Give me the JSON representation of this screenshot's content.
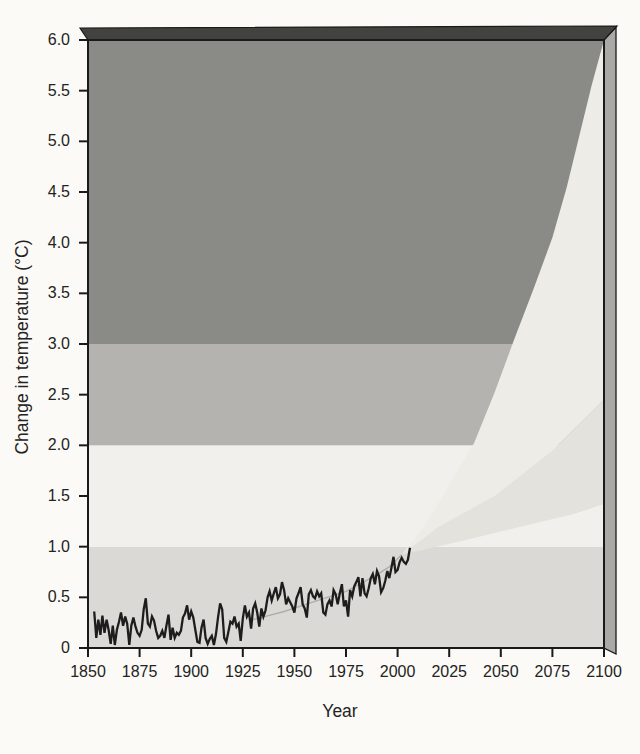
{
  "figure": {
    "kind": "textbook-climate-figure",
    "x_axis_title": "Year",
    "y_axis_title": "Change in temperature (°C)"
  },
  "chart_data": {
    "type": "line",
    "title": "",
    "xlabel": "Year",
    "ylabel": "Change in temperature (°C)",
    "xlim": [
      1850,
      2100
    ],
    "ylim": [
      0,
      6.0
    ],
    "grid": "off",
    "legend": "none",
    "x_ticks": [
      {
        "label": "1850",
        "value": 1850
      },
      {
        "label": "1875",
        "value": 1875
      },
      {
        "label": "1900",
        "value": 1900
      },
      {
        "label": "1925",
        "value": 1925
      },
      {
        "label": "1950",
        "value": 1950
      },
      {
        "label": "1975",
        "value": 1975
      },
      {
        "label": "2000",
        "value": 2000
      },
      {
        "label": "2025",
        "value": 2025
      },
      {
        "label": "2050",
        "value": 2050
      },
      {
        "label": "2075",
        "value": 2075
      },
      {
        "label": "2100",
        "value": 2100
      }
    ],
    "y_ticks": [
      {
        "label": "6.0",
        "value": 6.0
      },
      {
        "label": "5.5",
        "value": 5.5
      },
      {
        "label": "5.0",
        "value": 5.0
      },
      {
        "label": "4.5",
        "value": 4.5
      },
      {
        "label": "4.0",
        "value": 4.0
      },
      {
        "label": "3.5",
        "value": 3.5
      },
      {
        "label": "3.0",
        "value": 3.0
      },
      {
        "label": "2.5",
        "value": 2.5
      },
      {
        "label": "2.0",
        "value": 2.0
      },
      {
        "label": "1.5",
        "value": 1.5
      },
      {
        "label": "1.0",
        "value": 1.0
      },
      {
        "label": "0.5",
        "value": 0.5
      },
      {
        "label": "0",
        "value": 0
      }
    ],
    "background_bands": [
      {
        "range": [
          0,
          1
        ],
        "color": "#dad9d5"
      },
      {
        "range": [
          1,
          2
        ],
        "color": "#f1f0ec"
      },
      {
        "range": [
          2,
          3
        ],
        "color": "#b4b3af"
      },
      {
        "range": [
          3,
          6
        ],
        "color": "#8a8a86"
      }
    ],
    "observed": {
      "name": "observed-temperature-change",
      "points": [
        [
          1853,
          0.36
        ],
        [
          1854,
          0.1
        ],
        [
          1855,
          0.28
        ],
        [
          1856,
          0.13
        ],
        [
          1857,
          0.32
        ],
        [
          1858,
          0.15
        ],
        [
          1859,
          0.28
        ],
        [
          1860,
          0.18
        ],
        [
          1861,
          0.04
        ],
        [
          1862,
          0.22
        ],
        [
          1863,
          0.03
        ],
        [
          1864,
          0.18
        ],
        [
          1865,
          0.26
        ],
        [
          1866,
          0.35
        ],
        [
          1867,
          0.22
        ],
        [
          1868,
          0.31
        ],
        [
          1869,
          0.24
        ],
        [
          1870,
          0.03
        ],
        [
          1871,
          0.22
        ],
        [
          1872,
          0.3
        ],
        [
          1873,
          0.21
        ],
        [
          1874,
          0.15
        ],
        [
          1875,
          0.12
        ],
        [
          1876,
          0.18
        ],
        [
          1877,
          0.38
        ],
        [
          1878,
          0.49
        ],
        [
          1879,
          0.24
        ],
        [
          1880,
          0.21
        ],
        [
          1881,
          0.31
        ],
        [
          1882,
          0.27
        ],
        [
          1883,
          0.17
        ],
        [
          1884,
          0.1
        ],
        [
          1885,
          0.12
        ],
        [
          1886,
          0.17
        ],
        [
          1887,
          0.1
        ],
        [
          1888,
          0.22
        ],
        [
          1889,
          0.33
        ],
        [
          1890,
          0.08
        ],
        [
          1891,
          0.2
        ],
        [
          1892,
          0.1
        ],
        [
          1893,
          0.15
        ],
        [
          1894,
          0.13
        ],
        [
          1895,
          0.17
        ],
        [
          1896,
          0.3
        ],
        [
          1897,
          0.34
        ],
        [
          1898,
          0.42
        ],
        [
          1899,
          0.28
        ],
        [
          1900,
          0.36
        ],
        [
          1901,
          0.3
        ],
        [
          1902,
          0.18
        ],
        [
          1903,
          0.06
        ],
        [
          1904,
          0.05
        ],
        [
          1905,
          0.2
        ],
        [
          1906,
          0.28
        ],
        [
          1907,
          0.1
        ],
        [
          1908,
          0.04
        ],
        [
          1909,
          0.09
        ],
        [
          1910,
          0.12
        ],
        [
          1911,
          0.03
        ],
        [
          1912,
          0.14
        ],
        [
          1913,
          0.3
        ],
        [
          1914,
          0.44
        ],
        [
          1915,
          0.38
        ],
        [
          1916,
          0.1
        ],
        [
          1917,
          0.06
        ],
        [
          1918,
          0.16
        ],
        [
          1919,
          0.26
        ],
        [
          1920,
          0.24
        ],
        [
          1921,
          0.31
        ],
        [
          1922,
          0.21
        ],
        [
          1923,
          0.24
        ],
        [
          1924,
          0.07
        ],
        [
          1925,
          0.29
        ],
        [
          1926,
          0.42
        ],
        [
          1927,
          0.31
        ],
        [
          1928,
          0.35
        ],
        [
          1929,
          0.19
        ],
        [
          1930,
          0.39
        ],
        [
          1931,
          0.44
        ],
        [
          1932,
          0.35
        ],
        [
          1933,
          0.21
        ],
        [
          1934,
          0.39
        ],
        [
          1935,
          0.31
        ],
        [
          1936,
          0.37
        ],
        [
          1937,
          0.5
        ],
        [
          1938,
          0.56
        ],
        [
          1939,
          0.47
        ],
        [
          1940,
          0.54
        ],
        [
          1941,
          0.6
        ],
        [
          1942,
          0.49
        ],
        [
          1943,
          0.53
        ],
        [
          1944,
          0.65
        ],
        [
          1945,
          0.57
        ],
        [
          1946,
          0.43
        ],
        [
          1947,
          0.49
        ],
        [
          1948,
          0.45
        ],
        [
          1949,
          0.41
        ],
        [
          1950,
          0.35
        ],
        [
          1951,
          0.49
        ],
        [
          1952,
          0.54
        ],
        [
          1953,
          0.6
        ],
        [
          1954,
          0.43
        ],
        [
          1955,
          0.39
        ],
        [
          1956,
          0.3
        ],
        [
          1957,
          0.53
        ],
        [
          1958,
          0.57
        ],
        [
          1959,
          0.51
        ],
        [
          1960,
          0.49
        ],
        [
          1961,
          0.56
        ],
        [
          1962,
          0.51
        ],
        [
          1963,
          0.54
        ],
        [
          1964,
          0.35
        ],
        [
          1965,
          0.33
        ],
        [
          1966,
          0.43
        ],
        [
          1967,
          0.47
        ],
        [
          1968,
          0.41
        ],
        [
          1969,
          0.57
        ],
        [
          1970,
          0.53
        ],
        [
          1971,
          0.43
        ],
        [
          1972,
          0.54
        ],
        [
          1973,
          0.63
        ],
        [
          1974,
          0.41
        ],
        [
          1975,
          0.47
        ],
        [
          1976,
          0.31
        ],
        [
          1977,
          0.57
        ],
        [
          1978,
          0.51
        ],
        [
          1979,
          0.61
        ],
        [
          1980,
          0.65
        ],
        [
          1981,
          0.7
        ],
        [
          1982,
          0.51
        ],
        [
          1983,
          0.69
        ],
        [
          1984,
          0.54
        ],
        [
          1985,
          0.51
        ],
        [
          1986,
          0.59
        ],
        [
          1987,
          0.69
        ],
        [
          1988,
          0.73
        ],
        [
          1989,
          0.63
        ],
        [
          1990,
          0.76
        ],
        [
          1991,
          0.71
        ],
        [
          1992,
          0.55
        ],
        [
          1993,
          0.59
        ],
        [
          1994,
          0.66
        ],
        [
          1995,
          0.76
        ],
        [
          1996,
          0.69
        ],
        [
          1997,
          0.79
        ],
        [
          1998,
          0.9
        ],
        [
          1999,
          0.75
        ],
        [
          2000,
          0.77
        ],
        [
          2001,
          0.85
        ],
        [
          2002,
          0.89
        ],
        [
          2003,
          0.85
        ],
        [
          2004,
          0.83
        ],
        [
          2005,
          0.87
        ],
        [
          2006,
          0.99
        ]
      ]
    },
    "projection": {
      "name": "projected-range-fan",
      "range_at_2100_c": {
        "low": 1.4,
        "high": 6.0
      },
      "upper_edge": [
        [
          2002,
          0.92
        ],
        [
          2012,
          1.18
        ],
        [
          2022,
          1.5
        ],
        [
          2030,
          1.78
        ],
        [
          2037,
          2.02
        ],
        [
          2047,
          2.52
        ],
        [
          2056,
          3.02
        ],
        [
          2066,
          3.55
        ],
        [
          2075,
          4.05
        ],
        [
          2082,
          4.55
        ],
        [
          2088,
          5.05
        ],
        [
          2094,
          5.55
        ],
        [
          2100,
          6.0
        ]
      ],
      "mid_edge": [
        [
          2002,
          0.92
        ],
        [
          2020,
          1.2
        ],
        [
          2047,
          1.5
        ],
        [
          2075,
          1.95
        ],
        [
          2100,
          2.45
        ]
      ],
      "lower_edge": [
        [
          2002,
          0.92
        ],
        [
          2030,
          1.05
        ],
        [
          2060,
          1.2
        ],
        [
          2085,
          1.32
        ],
        [
          2100,
          1.42
        ]
      ],
      "trend_curve": [
        [
          1930,
          0.28
        ],
        [
          1945,
          0.36
        ],
        [
          1960,
          0.46
        ],
        [
          1975,
          0.56
        ],
        [
          1988,
          0.7
        ],
        [
          1996,
          0.8
        ],
        [
          2002,
          0.92
        ]
      ]
    },
    "colors": {
      "band_0_1": "#dad9d5",
      "band_1_2": "#f1f0ec",
      "band_2_3": "#b4b3af",
      "band_3_6": "#8a8a86",
      "fan_upper_zone": "#edece7",
      "fan_lower_zone": "#e3e2dd",
      "top_face": "#42423e",
      "side_face": "#aaa9a5",
      "frame": "#1a1a1a",
      "observed_line": "#1d1d1d",
      "trend_line": "rgba(110,110,105,0.40)",
      "text": "#232323",
      "page_bg": "#fbfaf6"
    }
  }
}
